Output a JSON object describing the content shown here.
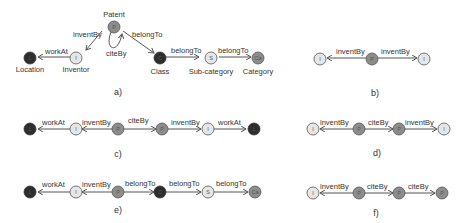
{
  "colors": {
    "inventor": "#e6e6e6",
    "patent": "#8c8c8c",
    "class": "#2e2e2e",
    "location": "#2e2e2e",
    "subcategory": "#e6e6e6",
    "category": "#8c8c8c",
    "stroke": "#555555"
  },
  "panels": {
    "a": {
      "caption": "a)",
      "nodes": {
        "patent": {
          "letter": "P",
          "label": "Patent"
        },
        "inventor": {
          "letter": "I",
          "label": "Inventor"
        },
        "location": {
          "letter": "L",
          "label": "Location"
        },
        "class": {
          "letter": "C",
          "label": "Class"
        },
        "subcategory": {
          "letter": "S",
          "label": "Sub-category"
        },
        "category": {
          "letter": "Ca",
          "label": "Category"
        }
      },
      "edges": {
        "workAt": "workAt",
        "inventBy": "inventBy",
        "citeBy": "citeBy",
        "belongTo1": "belongTo",
        "belongTo2": "belongTo",
        "belongTo3": "belongTo"
      }
    },
    "b": {
      "caption": "b)",
      "nodes": [
        "I",
        "P",
        "I"
      ],
      "edges": [
        "inventBy",
        "inventBy"
      ]
    },
    "c": {
      "caption": "c)",
      "nodes": [
        "L",
        "I",
        "P",
        "P",
        "I",
        "L"
      ],
      "edges": [
        "workAt",
        "inventBy",
        "citeBy",
        "inventBy",
        "workAt"
      ]
    },
    "d": {
      "caption": "d)",
      "nodes": [
        "I",
        "P",
        "P",
        "I"
      ],
      "edges": [
        "inventBy",
        "citeBy",
        "inventBy"
      ]
    },
    "e": {
      "caption": "e)",
      "nodes": [
        "L",
        "I",
        "P",
        "C",
        "S",
        "Ca"
      ],
      "edges": [
        "workAt",
        "inventBy",
        "belongTo",
        "belongTo",
        "belongTo"
      ]
    },
    "f": {
      "caption": "f)",
      "nodes": [
        "I",
        "P",
        "P",
        "P"
      ],
      "edges": [
        "inventBy",
        "citeBy",
        "citeBy"
      ]
    }
  }
}
